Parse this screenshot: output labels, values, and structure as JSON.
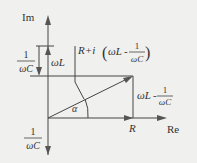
{
  "diagram": {
    "type": "phasor-diagram",
    "axes": {
      "vertical": "Im",
      "horizontal": "Re"
    },
    "labels": {
      "im_axis": "Im",
      "re_axis": "Re",
      "omega_L": "ωL",
      "one_over_omega_C_top_num": "1",
      "one_over_omega_C_top_den": "ωC",
      "one_over_omega_C_bottom_num": "1",
      "one_over_omega_C_bottom_den": "ωC",
      "impedance_prefix": "R+i",
      "impedance_open": "(",
      "impedance_wl": "ωL",
      "impedance_minus": "-",
      "impedance_num": "1",
      "impedance_den": "ωC",
      "impedance_close": ")",
      "reactance_wl": "ωL",
      "reactance_minus": "-",
      "reactance_num": "1",
      "reactance_den": "ωC",
      "resistance": "R",
      "angle": "α"
    },
    "colors": {
      "background": "#f0f0ee",
      "line": "#444444",
      "arrow_fill": "#555555",
      "text": "#333333"
    }
  }
}
